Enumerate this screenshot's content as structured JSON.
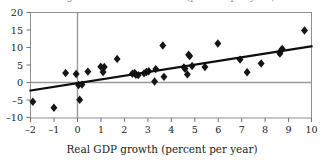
{
  "figure": {
    "clipped_top_text": "the growth rate of real GDP (percent per year)",
    "background_color": "#ffffff"
  },
  "chart_data": {
    "type": "scatter",
    "title": "",
    "xlabel": "Real GDP growth (percent per year)",
    "ylabel": "",
    "xlim": [
      -2,
      10
    ],
    "ylim": [
      -10,
      20
    ],
    "xticks": [
      -2,
      -1,
      0,
      1,
      2,
      3,
      4,
      5,
      6,
      7,
      8,
      9,
      10
    ],
    "yticks": [
      -10,
      -5,
      0,
      5,
      10,
      15,
      20
    ],
    "xtick_labels": [
      "–2",
      "–1",
      "0",
      "1",
      "2",
      "3",
      "4",
      "5",
      "6",
      "7",
      "8",
      "9",
      "10"
    ],
    "ytick_labels": [
      "–10",
      "–5",
      "0",
      "5",
      "10",
      "15",
      "20"
    ],
    "grid": false,
    "zero_lines": {
      "horizontal_y": 0,
      "vertical_x": 0,
      "color": "#9a9a9a"
    },
    "legend": null,
    "marker": {
      "shape": "diamond",
      "color": "#151515",
      "size": 4.2
    },
    "points": [
      {
        "x": -1.9,
        "y": -5.4
      },
      {
        "x": -1.0,
        "y": -7.1
      },
      {
        "x": -0.5,
        "y": 2.8
      },
      {
        "x": -0.05,
        "y": 2.5
      },
      {
        "x": 0.05,
        "y": -0.6
      },
      {
        "x": 0.1,
        "y": -4.8
      },
      {
        "x": 0.2,
        "y": -0.5
      },
      {
        "x": 0.45,
        "y": 3.2
      },
      {
        "x": 1.0,
        "y": 4.6
      },
      {
        "x": 1.1,
        "y": 3.1
      },
      {
        "x": 1.15,
        "y": 4.5
      },
      {
        "x": 1.7,
        "y": 6.8
      },
      {
        "x": 2.35,
        "y": 2.6
      },
      {
        "x": 2.45,
        "y": 2.8
      },
      {
        "x": 2.5,
        "y": 2.3
      },
      {
        "x": 2.6,
        "y": 2.2
      },
      {
        "x": 2.85,
        "y": 2.7
      },
      {
        "x": 2.95,
        "y": 3.1
      },
      {
        "x": 3.05,
        "y": 3.3
      },
      {
        "x": 3.3,
        "y": 0.4
      },
      {
        "x": 3.35,
        "y": 3.9
      },
      {
        "x": 3.65,
        "y": 10.6
      },
      {
        "x": 3.7,
        "y": 1.7
      },
      {
        "x": 4.55,
        "y": 4.4
      },
      {
        "x": 4.6,
        "y": 4.0
      },
      {
        "x": 4.7,
        "y": 2.4
      },
      {
        "x": 4.75,
        "y": 8.0
      },
      {
        "x": 4.8,
        "y": 7.6
      },
      {
        "x": 4.9,
        "y": 4.8
      },
      {
        "x": 5.45,
        "y": 4.5
      },
      {
        "x": 6.0,
        "y": 11.2
      },
      {
        "x": 6.95,
        "y": 6.6
      },
      {
        "x": 7.25,
        "y": 3.0
      },
      {
        "x": 7.85,
        "y": 5.5
      },
      {
        "x": 8.65,
        "y": 8.3
      },
      {
        "x": 8.7,
        "y": 9.2
      },
      {
        "x": 8.75,
        "y": 9.6
      },
      {
        "x": 9.7,
        "y": 14.9
      }
    ],
    "trend_line": {
      "type": "linear-fit",
      "from": {
        "x": -2.0,
        "y": -2.2
      },
      "to": {
        "x": 10.0,
        "y": 10.4
      },
      "slope": 1.05,
      "intercept": -0.1,
      "color": "#0d0d0d",
      "width": 2.1
    },
    "frame": {
      "color": "#8f8f8f",
      "width": 1
    }
  }
}
